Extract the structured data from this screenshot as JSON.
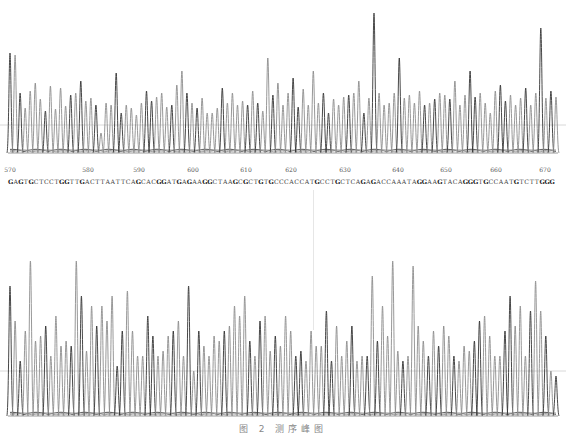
{
  "chart_data": {
    "type": "line",
    "title": "",
    "subtitle": "DNA sequencing chromatogram (Sanger trace), grayscale",
    "xlabel": "Base position",
    "ylabel": "Fluorescence intensity",
    "grid": false,
    "legend": null,
    "position_ticks": [
      570,
      580,
      590,
      600,
      610,
      620,
      630,
      640,
      650,
      660,
      670
    ],
    "position_tick_x": [
      10,
      88,
      139,
      193,
      246,
      291,
      345,
      398,
      446,
      496,
      545
    ],
    "sequence_start": 566,
    "sequence": "GAGTGCTCCTGGTTGACTTAATTCAGCACGGATGAGAAGGCTAAGCGCTGTGCCCACCATGCCTGCTCAGAGACCAAATAGGAAGTACAGGGTGCCAATGTCTTGGG",
    "traces": [
      {
        "name": "top-panel",
        "x_range": [
          10,
          556
        ],
        "baseline_y": 153,
        "threshold_y": 125,
        "peak_heights": [
          100,
          98,
          60,
          45,
          62,
          70,
          54,
          42,
          67,
          44,
          65,
          47,
          58,
          60,
          72,
          52,
          55,
          48,
          20,
          50,
          48,
          80,
          40,
          48,
          45,
          38,
          50,
          62,
          52,
          56,
          60,
          46,
          48,
          68,
          82,
          60,
          50,
          45,
          55,
          40,
          40,
          45,
          65,
          50,
          60,
          48,
          52,
          48,
          62,
          50,
          42,
          95,
          58,
          70,
          48,
          60,
          75,
          46,
          64,
          48,
          82,
          50,
          60,
          40,
          54,
          48,
          56,
          58,
          60,
          72,
          40,
          55,
          140,
          60,
          48,
          50,
          60,
          95,
          55,
          58,
          50,
          62,
          48,
          50,
          54,
          60,
          58,
          54,
          72,
          48,
          58,
          82,
          56,
          60,
          50,
          40,
          62,
          68,
          52,
          58,
          48,
          55,
          65,
          48,
          60,
          125,
          55,
          62,
          56
        ]
      },
      {
        "name": "bottom-panel",
        "x_range": [
          10,
          556
        ],
        "baseline_y": 168,
        "threshold_y": 123,
        "peak_heights": [
          130,
          95,
          55,
          85,
          155,
          75,
          80,
          90,
          60,
          100,
          70,
          75,
          70,
          155,
          120,
          65,
          110,
          90,
          110,
          95,
          120,
          50,
          85,
          125,
          85,
          60,
          60,
          100,
          80,
          60,
          65,
          80,
          85,
          95,
          60,
          130,
          45,
          85,
          70,
          60,
          80,
          75,
          85,
          90,
          110,
          100,
          120,
          75,
          60,
          95,
          100,
          65,
          80,
          70,
          100,
          85,
          60,
          65,
          55,
          85,
          70,
          70,
          105,
          55,
          90,
          60,
          75,
          90,
          55,
          60,
          60,
          140,
          75,
          110,
          80,
          155,
          65,
          55,
          60,
          150,
          90,
          75,
          60,
          85,
          70,
          90,
          80,
          60,
          55,
          70,
          65,
          75,
          95,
          100,
          80,
          60,
          60,
          85,
          120,
          90,
          110,
          60,
          105,
          135,
          105,
          80,
          45,
          40
        ]
      }
    ],
    "cursor_x": 313,
    "ylim": [
      0,
      160
    ]
  },
  "caption": "图 2  测序峰图"
}
